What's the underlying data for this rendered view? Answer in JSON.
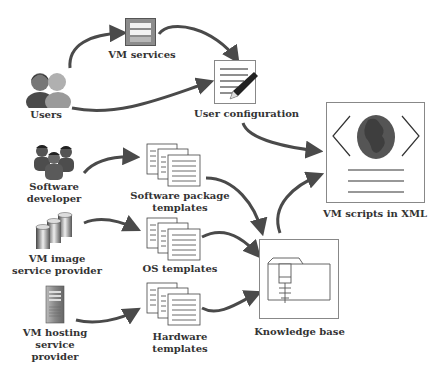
{
  "diagram": {
    "nodes": {
      "users": {
        "label": "Users",
        "icon": "users-icon"
      },
      "vm_services": {
        "label": "VM services",
        "icon": "server-panel-icon"
      },
      "user_configuration": {
        "label": "User configuration",
        "icon": "document-pen-icon"
      },
      "software_developer": {
        "label_line1": "Software",
        "label_line2": "developer",
        "icon": "developers-icon"
      },
      "vm_image_provider": {
        "label_line1": "VM image",
        "label_line2": "service provider",
        "icon": "database-cylinders-icon"
      },
      "vm_hosting_provider": {
        "label_line1": "VM hosting",
        "label_line2": "service",
        "label_line3": "provider",
        "icon": "tower-server-icon"
      },
      "software_package_templates": {
        "label_line1": "Software package",
        "label_line2": "templates",
        "icon": "stacked-documents-icon"
      },
      "os_templates": {
        "label": "OS templates",
        "icon": "stacked-documents-icon"
      },
      "hardware_templates": {
        "label_line1": "Hardware",
        "label_line2": "templates",
        "icon": "stacked-documents-icon"
      },
      "knowledge_base": {
        "label": "Knowledge base",
        "icon": "knowledge-folder-icon"
      },
      "vm_scripts_xml": {
        "label": "VM scripts in XML",
        "icon": "xml-globe-icon"
      }
    },
    "edges": [
      {
        "from": "users",
        "to": "vm_services"
      },
      {
        "from": "users",
        "to": "user_configuration"
      },
      {
        "from": "vm_services",
        "to": "user_configuration"
      },
      {
        "from": "user_configuration",
        "to": "vm_scripts_xml"
      },
      {
        "from": "software_developer",
        "to": "software_package_templates"
      },
      {
        "from": "vm_image_provider",
        "to": "os_templates"
      },
      {
        "from": "vm_hosting_provider",
        "to": "hardware_templates"
      },
      {
        "from": "software_package_templates",
        "to": "knowledge_base"
      },
      {
        "from": "os_templates",
        "to": "knowledge_base"
      },
      {
        "from": "hardware_templates",
        "to": "knowledge_base"
      },
      {
        "from": "knowledge_base",
        "to": "vm_scripts_xml"
      }
    ],
    "colors": {
      "arrow": "#4a4a4a",
      "text": "#333333",
      "box_border": "#8a8a8a"
    }
  }
}
